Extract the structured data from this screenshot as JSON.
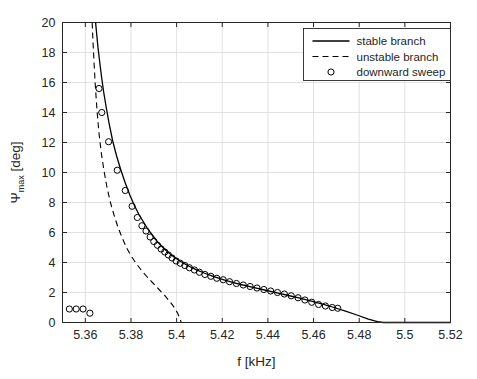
{
  "figure": {
    "background_color": "#ffffff",
    "axis_color": "#262626",
    "grid_color": "#d9d9d9",
    "series_color": "#000000"
  },
  "chart_data": {
    "type": "line",
    "title": "",
    "xlabel": "f [kHz]",
    "ylabel_main": "Ψ",
    "ylabel_sub": "max",
    "ylabel_unit": " [deg]",
    "ylabel": "Ψ_max [deg]",
    "xlim": [
      5.35,
      5.52
    ],
    "ylim": [
      0,
      20
    ],
    "grid": true,
    "xticks": [
      5.36,
      5.38,
      5.4,
      5.42,
      5.44,
      5.46,
      5.48,
      5.5,
      5.52
    ],
    "xticklabels": [
      "5.36",
      "5.38",
      "5.4",
      "5.42",
      "5.44",
      "5.46",
      "5.48",
      "5.5",
      "5.52"
    ],
    "yticks": [
      0,
      2,
      4,
      6,
      8,
      10,
      12,
      14,
      16,
      18,
      20
    ],
    "yticklabels": [
      "0",
      "2",
      "4",
      "6",
      "8",
      "10",
      "12",
      "14",
      "16",
      "18",
      "20"
    ],
    "legend": {
      "position": "top-right",
      "entries": [
        {
          "label": "stable branch",
          "style": "solid-line"
        },
        {
          "label": "unstable branch",
          "style": "dashed-line"
        },
        {
          "label": "downward sweep",
          "style": "circle-marker"
        }
      ]
    },
    "series": [
      {
        "name": "stable branch",
        "style": "solid-line",
        "x": [
          5.3645,
          5.365,
          5.3655,
          5.3662,
          5.367,
          5.368,
          5.3692,
          5.3705,
          5.372,
          5.3737,
          5.3755,
          5.3775,
          5.3795,
          5.3815,
          5.3835,
          5.3855,
          5.3875,
          5.3895,
          5.3915,
          5.394,
          5.3965,
          5.399,
          5.402,
          5.405,
          5.4085,
          5.412,
          5.416,
          5.42,
          5.4245,
          5.429,
          5.434,
          5.439,
          5.444,
          5.449,
          5.454,
          5.459,
          5.464,
          5.469,
          5.474,
          5.479,
          5.484,
          5.488,
          5.4905,
          5.495,
          5.5,
          5.51,
          5.52
        ],
        "y": [
          20.0,
          19.2,
          18.4,
          17.5,
          16.5,
          15.4,
          14.3,
          13.2,
          12.1,
          11.1,
          10.2,
          9.3,
          8.5,
          7.8,
          7.2,
          6.7,
          6.2,
          5.8,
          5.4,
          5.0,
          4.65,
          4.35,
          4.05,
          3.78,
          3.52,
          3.3,
          3.08,
          2.88,
          2.68,
          2.5,
          2.32,
          2.15,
          1.98,
          1.8,
          1.62,
          1.43,
          1.22,
          1.0,
          0.76,
          0.5,
          0.22,
          0.06,
          0.0,
          0.0,
          0.0,
          0.0,
          0.0
        ]
      },
      {
        "name": "unstable branch",
        "style": "dashed-line",
        "x": [
          5.363,
          5.3634,
          5.3639,
          5.3645,
          5.3652,
          5.366,
          5.367,
          5.3682,
          5.3695,
          5.371,
          5.3725,
          5.3742,
          5.376,
          5.378,
          5.38,
          5.3822,
          5.3845,
          5.387,
          5.3895,
          5.392,
          5.3945,
          5.397,
          5.399,
          5.4005,
          5.4015,
          5.402,
          5.41,
          5.42,
          5.43,
          5.44,
          5.45,
          5.46,
          5.47,
          5.48,
          5.49,
          5.5,
          5.51,
          5.52
        ],
        "y": [
          20.0,
          18.6,
          17.1,
          15.5,
          14.0,
          12.6,
          11.3,
          10.1,
          9.0,
          8.0,
          7.2,
          6.4,
          5.7,
          5.0,
          4.45,
          3.95,
          3.5,
          3.05,
          2.65,
          2.25,
          1.85,
          1.4,
          1.0,
          0.6,
          0.25,
          0.0,
          0.0,
          0.0,
          0.0,
          0.0,
          0.0,
          0.0,
          0.0,
          0.0,
          0.0,
          0.0,
          0.0,
          0.0
        ]
      },
      {
        "name": "downward sweep",
        "style": "circle-marker",
        "x": [
          5.366,
          5.3672,
          5.3702,
          5.374,
          5.3775,
          5.3805,
          5.3828,
          5.3848,
          5.3866,
          5.3884,
          5.39,
          5.3916,
          5.3932,
          5.3948,
          5.3964,
          5.398,
          5.3998,
          5.4016,
          5.4036,
          5.4056,
          5.4078,
          5.41,
          5.4124,
          5.415,
          5.4176,
          5.4204,
          5.4232,
          5.4262,
          5.4292,
          5.4322,
          5.4352,
          5.4382,
          5.4412,
          5.4442,
          5.4472,
          5.4502,
          5.4532,
          5.4562,
          5.4592,
          5.4622,
          5.4652,
          5.4682,
          5.4706,
          5.353,
          5.356,
          5.359,
          5.362
        ],
        "y": [
          15.6,
          14.0,
          12.05,
          10.15,
          8.8,
          7.75,
          7.0,
          6.45,
          6.1,
          5.7,
          5.4,
          5.15,
          4.9,
          4.7,
          4.5,
          4.3,
          4.1,
          3.95,
          3.8,
          3.65,
          3.5,
          3.35,
          3.2,
          3.08,
          2.95,
          2.85,
          2.72,
          2.6,
          2.5,
          2.4,
          2.3,
          2.2,
          2.1,
          2.0,
          1.9,
          1.78,
          1.65,
          1.5,
          1.35,
          1.2,
          1.1,
          1.0,
          0.95,
          0.9,
          0.9,
          0.9,
          0.62
        ]
      }
    ]
  }
}
